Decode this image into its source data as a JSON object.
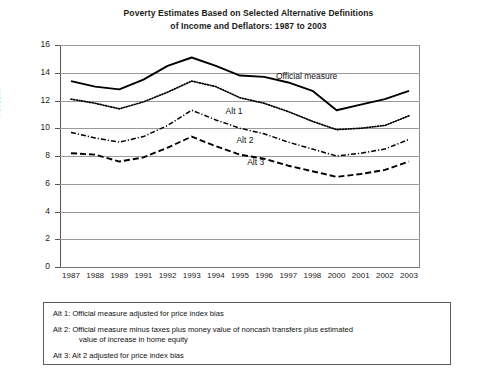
{
  "chart_data": {
    "type": "line",
    "title": "Poverty Estimates Based on Selected Alternative Definitions of Income and Deflators: 1987 to 2003",
    "title_line1": "Poverty Estimates Based on Selected Alternative Definitions",
    "title_line2": "of Income and Deflators: 1987 to 2003",
    "xlabel": "",
    "ylabel": "Percent",
    "ylim": [
      0,
      16
    ],
    "yticks": [
      0,
      2,
      4,
      6,
      8,
      10,
      12,
      14,
      16
    ],
    "grid": true,
    "legend_position": "inline-labels",
    "categories": [
      "1987",
      "1988",
      "1989",
      "1991",
      "1992",
      "1993",
      "1994",
      "1995",
      "1996",
      "1997",
      "1998",
      "2000",
      "2001",
      "2002",
      "2003"
    ],
    "series": [
      {
        "name": "Official measure",
        "style": "solid",
        "values": [
          13.4,
          13.0,
          12.8,
          13.5,
          14.5,
          15.1,
          14.5,
          13.8,
          13.7,
          13.3,
          12.7,
          11.3,
          11.7,
          12.1,
          12.7
        ]
      },
      {
        "name": "Alt 1",
        "style": "dotted",
        "values": [
          12.1,
          11.8,
          11.4,
          11.9,
          12.6,
          13.4,
          13.0,
          12.2,
          11.8,
          11.2,
          10.5,
          9.9,
          10.0,
          10.2,
          10.9
        ]
      },
      {
        "name": "Alt 2",
        "style": "dash-dot",
        "values": [
          9.7,
          9.3,
          9.0,
          9.4,
          10.2,
          11.3,
          10.6,
          10.0,
          9.6,
          9.0,
          8.5,
          8.0,
          8.2,
          8.5,
          9.2
        ]
      },
      {
        "name": "Alt 3",
        "style": "dashed",
        "values": [
          8.2,
          8.1,
          7.6,
          7.9,
          8.6,
          9.4,
          8.7,
          8.1,
          7.8,
          7.3,
          6.9,
          6.5,
          6.7,
          7.0,
          7.6
        ]
      }
    ],
    "inline_labels": [
      {
        "text": "Official measure",
        "x": 0.6,
        "y": 13.7
      },
      {
        "text": "Alt 1",
        "x": 0.46,
        "y": 11.2
      },
      {
        "text": "Alt 2",
        "x": 0.49,
        "y": 9.1
      },
      {
        "text": "Alt 3",
        "x": 0.52,
        "y": 7.5
      }
    ]
  },
  "notes": [
    {
      "label": "Alt 1:",
      "text": "Official measure adjusted for price index bias",
      "cont": ""
    },
    {
      "label": "Alt 2:",
      "text": "Official measure minus taxes plus money value of noncash transfers plus estimated",
      "cont": "value of increase in home equity"
    },
    {
      "label": "Alt 3:",
      "text": "Alt 2 adjusted for price index bias",
      "cont": ""
    }
  ]
}
